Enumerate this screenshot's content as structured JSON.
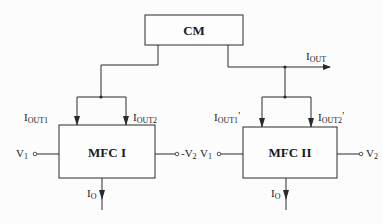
{
  "blocks": {
    "cm": {
      "label": "CM"
    },
    "mfc1": {
      "label": "MFC I"
    },
    "mfc2": {
      "label": "MFC II"
    }
  },
  "signals": {
    "iout": {
      "main": "I",
      "sub": "OUT"
    },
    "mfc1_iout1": {
      "main": "I",
      "sub": "OUT1"
    },
    "mfc1_iout2": {
      "main": "I",
      "sub": "OUT2"
    },
    "mfc1_io": {
      "main": "I",
      "sub": "O"
    },
    "mfc1_v1": {
      "main": "V",
      "sub": "1"
    },
    "mfc1_v2": {
      "main": "-V",
      "sub": "2"
    },
    "mfc2_iout1": {
      "main": "I",
      "sub": "OUT1",
      "suffix": "'"
    },
    "mfc2_iout2": {
      "main": "I",
      "sub": "OUT2",
      "suffix": "'"
    },
    "mfc2_io": {
      "main": "I",
      "sub": "O"
    },
    "mfc2_v1": {
      "main": "V",
      "sub": "1"
    },
    "mfc2_v2": {
      "main": "V",
      "sub": "2"
    }
  },
  "colors": {
    "line": "#2a2a2a",
    "background": "#fcfcfc"
  }
}
